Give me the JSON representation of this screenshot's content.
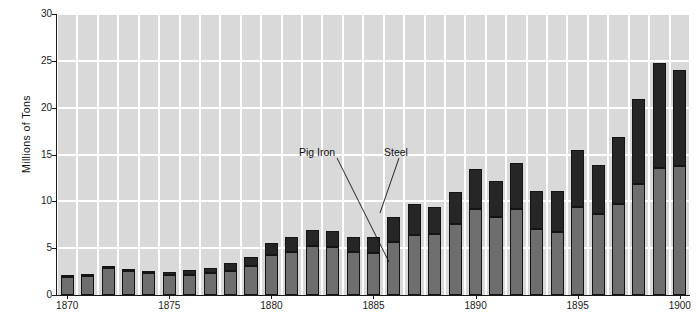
{
  "chart_data": {
    "type": "bar",
    "stacked": true,
    "title": "",
    "subtitle": "",
    "xlabel": "",
    "ylabel": "Millions of Tons",
    "ylim": [
      0,
      30
    ],
    "ytick_values": [
      0,
      5,
      10,
      15,
      20,
      25,
      30
    ],
    "ytick_labels": [
      "0",
      "5",
      "10",
      "15",
      "20",
      "25",
      "30"
    ],
    "xlim": [
      1870,
      1900
    ],
    "xtick_values": [
      1870,
      1875,
      1880,
      1885,
      1890,
      1895,
      1900
    ],
    "xtick_labels": [
      "1870",
      "1875",
      "1880",
      "1885",
      "1890",
      "1895",
      "1900"
    ],
    "grid": true,
    "grid_color": "#ffffff",
    "plot_background": "#d9d9d9",
    "legend_position": "annotations-inline",
    "categories": [
      "1870",
      "1871",
      "1872",
      "1873",
      "1874",
      "1875",
      "1876",
      "1877",
      "1878",
      "1879",
      "1880",
      "1881",
      "1882",
      "1883",
      "1884",
      "1885",
      "1886",
      "1887",
      "1888",
      "1889",
      "1890",
      "1891",
      "1892",
      "1893",
      "1894",
      "1895",
      "1896",
      "1897",
      "1898",
      "1899",
      "1900"
    ],
    "series": [
      {
        "name": "Pig Iron",
        "color": "#6e6e6e",
        "values": [
          1.9,
          2.0,
          2.9,
          2.6,
          2.4,
          2.1,
          2.1,
          2.3,
          2.6,
          3.1,
          4.3,
          4.6,
          5.2,
          5.1,
          4.6,
          4.5,
          5.7,
          6.4,
          6.5,
          7.6,
          9.2,
          8.3,
          9.2,
          7.1,
          6.7,
          9.4,
          8.6,
          9.7,
          11.8,
          13.6,
          13.8
        ]
      },
      {
        "name": "Steel",
        "color": "#262626",
        "values": [
          0.1,
          0.2,
          0.2,
          0.2,
          0.2,
          0.4,
          0.6,
          0.6,
          0.8,
          1.0,
          1.3,
          1.6,
          1.7,
          1.7,
          1.6,
          1.7,
          2.6,
          3.3,
          2.9,
          3.4,
          4.3,
          3.9,
          4.9,
          4.0,
          4.4,
          6.1,
          5.3,
          7.2,
          9.1,
          11.2,
          10.2
        ]
      }
    ],
    "totals": [
      2.0,
      2.2,
      3.1,
      2.8,
      2.6,
      2.5,
      2.7,
      2.9,
      3.4,
      4.1,
      5.6,
      6.2,
      6.9,
      6.8,
      6.2,
      6.2,
      8.3,
      9.7,
      9.4,
      11.0,
      13.5,
      12.2,
      14.1,
      11.1,
      11.1,
      15.5,
      13.9,
      16.9,
      20.9,
      24.8,
      24.0
    ],
    "annotations": [
      {
        "label": "Pig Iron",
        "text_x": 299,
        "text_y": 146,
        "line_x1": 337,
        "line_y1": 158,
        "line_x2": 389,
        "line_y2": 262
      },
      {
        "label": "Steel",
        "text_x": 384,
        "text_y": 146,
        "line_x1": 399,
        "line_y1": 158,
        "line_x2": 380,
        "line_y2": 213
      }
    ]
  }
}
